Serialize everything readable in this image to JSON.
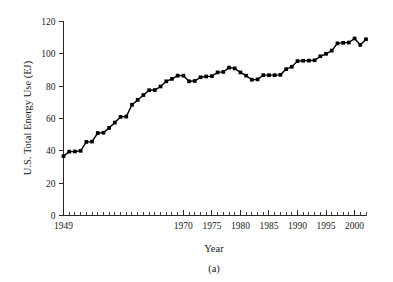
{
  "chart_data": {
    "type": "line",
    "title": "",
    "subtitle": "",
    "caption": "(a)",
    "xlabel": "Year",
    "ylabel": "U.S. Total Energy Use (EJ)",
    "xlim": [
      1949,
      2002
    ],
    "ylim": [
      0,
      120
    ],
    "grid": false,
    "legend": null,
    "legend_position": "none",
    "marker": "filled-square",
    "line_color": "#000000",
    "marker_color": "#000000",
    "y_ticks": [
      0,
      20,
      40,
      60,
      80,
      100,
      120
    ],
    "y_tick_labels": [
      "0",
      "20",
      "40",
      "60",
      "80",
      "100",
      "120"
    ],
    "x_ticks": [
      1949,
      1970,
      1975,
      1980,
      1985,
      1990,
      1995,
      2000
    ],
    "x_tick_labels": [
      "1949",
      "1970",
      "1975",
      "1980",
      "1985",
      "1990",
      "1995",
      "2000"
    ],
    "x_minor_tick_interval": 1,
    "series": [
      {
        "name": "U.S. Total Energy Use",
        "x": [
          1949,
          1950,
          1951,
          1952,
          1953,
          1954,
          1955,
          1956,
          1957,
          1958,
          1959,
          1960,
          1961,
          1962,
          1963,
          1964,
          1965,
          1966,
          1967,
          1968,
          1969,
          1970,
          1971,
          1972,
          1973,
          1974,
          1975,
          1976,
          1977,
          1978,
          1979,
          1980,
          1981,
          1982,
          1983,
          1984,
          1985,
          1986,
          1987,
          1988,
          1989,
          1990,
          1991,
          1992,
          1993,
          1994,
          1995,
          1996,
          1997,
          1998,
          1999,
          2000,
          2001,
          2002
        ],
        "values": [
          36.7,
          39.5,
          39.6,
          40.0,
          45.5,
          45.7,
          51.0,
          51.2,
          54.2,
          57.5,
          61.0,
          61.2,
          68.5,
          71.5,
          74.5,
          77.5,
          77.6,
          79.8,
          83.0,
          84.5,
          86.5,
          86.5,
          83.0,
          83.2,
          85.5,
          86.0,
          86.2,
          88.5,
          88.8,
          91.5,
          91.0,
          88.5,
          86.5,
          84.0,
          84.2,
          86.8,
          86.8,
          86.8,
          87.0,
          90.5,
          92.0,
          95.5,
          95.7,
          95.8,
          96.0,
          98.5,
          100.0,
          102.0,
          106.5,
          106.8,
          107.0,
          109.5,
          105.5,
          109.0
        ]
      }
    ]
  },
  "axes": {
    "y_axis_label": "U.S. Total Energy Use (EJ)",
    "x_axis_label": "Year"
  },
  "figure": {
    "caption_label": "(a)"
  }
}
